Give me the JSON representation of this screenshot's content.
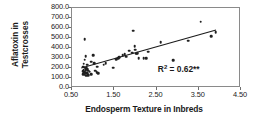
{
  "chart_data": {
    "type": "scatter",
    "title": "",
    "xlabel": "Endosperm Texture in Inbreds",
    "ylabel_line1": "Aflatoxin in",
    "ylabel_line2": "Testcrosses",
    "ylabel": "Aflatoxin in Testcrosses",
    "xlim": [
      0.5,
      4.5
    ],
    "ylim": [
      0.0,
      800.0
    ],
    "xticks": [
      "0.50",
      "1.50",
      "2.50",
      "3.50",
      "4.50"
    ],
    "xtick_values": [
      0.5,
      1.5,
      2.5,
      3.5,
      4.5
    ],
    "yticks": [
      "0.0",
      "100.0",
      "200.0",
      "300.0",
      "400.0",
      "500.0",
      "600.0",
      "700.0",
      "800.0"
    ],
    "ytick_values": [
      0,
      100,
      200,
      300,
      400,
      500,
      600,
      700,
      800
    ],
    "grid": false,
    "legend": null,
    "marker": "filled-circle",
    "marker_color": "#202020",
    "frame_color": "#8a8a8a",
    "annotations": [
      {
        "name": "r-squared",
        "text_prefix": "R",
        "text_sup": "2",
        "text_suffix": " = 0.62**",
        "text": "R2 = 0.62**",
        "x": 3.05,
        "y": 185
      }
    ],
    "trendline": {
      "type": "linear",
      "x": [
        0.72,
        3.95
      ],
      "y": [
        185,
        575
      ],
      "color": "#1a1a1a"
    },
    "points": [
      [
        0.8,
        490
      ],
      [
        0.82,
        320
      ],
      [
        0.8,
        285
      ],
      [
        1.0,
        330
      ],
      [
        0.78,
        245
      ],
      [
        0.86,
        235
      ],
      [
        0.95,
        265
      ],
      [
        1.02,
        250
      ],
      [
        0.76,
        215
      ],
      [
        0.8,
        205
      ],
      [
        0.84,
        200
      ],
      [
        0.86,
        190
      ],
      [
        0.78,
        185
      ],
      [
        0.82,
        178
      ],
      [
        0.88,
        172
      ],
      [
        0.76,
        168
      ],
      [
        0.8,
        160
      ],
      [
        0.84,
        155
      ],
      [
        0.78,
        150
      ],
      [
        0.86,
        148
      ],
      [
        0.82,
        142
      ],
      [
        0.76,
        138
      ],
      [
        0.8,
        132
      ],
      [
        0.88,
        128
      ],
      [
        0.84,
        122
      ],
      [
        0.92,
        165
      ],
      [
        0.96,
        140
      ],
      [
        1.05,
        175
      ],
      [
        1.1,
        215
      ],
      [
        1.08,
        160
      ],
      [
        1.12,
        150
      ],
      [
        1.25,
        235
      ],
      [
        1.3,
        250
      ],
      [
        1.48,
        205
      ],
      [
        1.55,
        290
      ],
      [
        1.6,
        300
      ],
      [
        1.62,
        310
      ],
      [
        1.7,
        330
      ],
      [
        1.75,
        340
      ],
      [
        1.78,
        315
      ],
      [
        1.85,
        375
      ],
      [
        1.92,
        355
      ],
      [
        1.95,
        575
      ],
      [
        1.98,
        420
      ],
      [
        2.0,
        385
      ],
      [
        2.02,
        345
      ],
      [
        2.05,
        350
      ],
      [
        2.08,
        300
      ],
      [
        2.2,
        300
      ],
      [
        2.25,
        300
      ],
      [
        2.3,
        365
      ],
      [
        2.6,
        460
      ],
      [
        2.9,
        280
      ],
      [
        3.25,
        475
      ],
      [
        3.55,
        665
      ],
      [
        3.8,
        520
      ],
      [
        3.9,
        560
      ]
    ]
  }
}
